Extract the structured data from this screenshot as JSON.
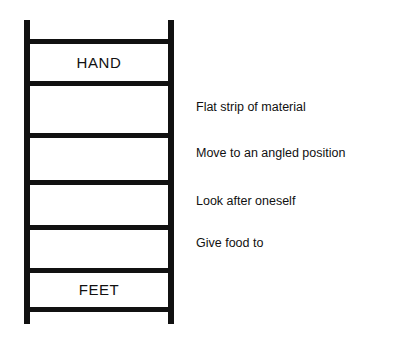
{
  "worksheet": {
    "background_color": "#ffffff",
    "ink_color": "#111111"
  },
  "ladder": {
    "name": "word-ladder",
    "top_label": "HAND",
    "bottom_label": "FEET",
    "rung_count": 7,
    "step_count": 6
  },
  "clues": [
    {
      "text": "Flat strip of material"
    },
    {
      "text": "Move to an angled position"
    },
    {
      "text": "Look after oneself"
    },
    {
      "text": "Give food to"
    }
  ]
}
